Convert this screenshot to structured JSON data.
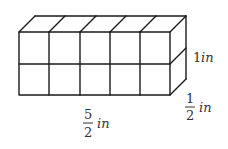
{
  "diagram": {
    "cube_grid": {
      "columns": 5,
      "rows": 2,
      "depth_layers": 1
    },
    "colors": {
      "line": "#1a1a1a",
      "text": "#333333",
      "background": "#ffffff"
    },
    "labels": {
      "height": {
        "value": "1",
        "unit": "in"
      },
      "depth": {
        "numerator": "1",
        "denominator": "2",
        "unit": "in"
      },
      "length": {
        "numerator": "5",
        "denominator": "2",
        "unit": "in"
      }
    }
  }
}
